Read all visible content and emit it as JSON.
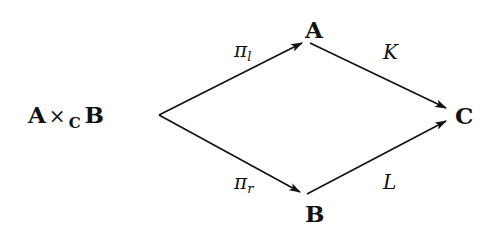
{
  "diagram": {
    "type": "commutative-diagram",
    "nodes": {
      "product": {
        "left": "A",
        "op": "×",
        "sub": "C",
        "right": "B"
      },
      "A": {
        "label": "A"
      },
      "B": {
        "label": "B"
      },
      "C": {
        "label": "C"
      }
    },
    "edges": [
      {
        "from": "product",
        "to": "A",
        "label_base": "π",
        "label_sub": "l"
      },
      {
        "from": "product",
        "to": "B",
        "label_base": "π",
        "label_sub": "r"
      },
      {
        "from": "A",
        "to": "C",
        "label": "K"
      },
      {
        "from": "B",
        "to": "C",
        "label": "L"
      }
    ],
    "colors": {
      "stroke": "#111111",
      "background": "#ffffff"
    }
  }
}
